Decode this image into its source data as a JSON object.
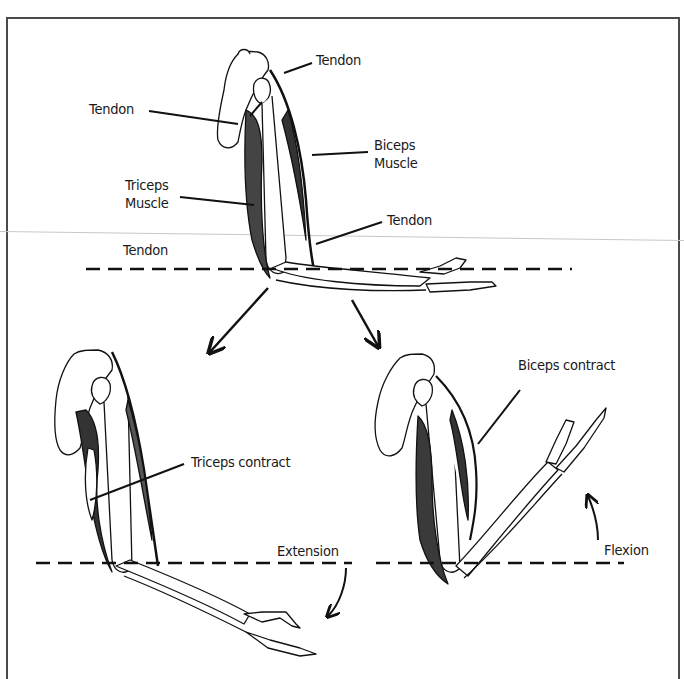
{
  "figure": {
    "colors": {
      "line": "#111111",
      "bone_fill": "#ffffff",
      "muscle": "#222222",
      "frame": "#4a4a4a"
    }
  },
  "top_arm": {
    "labels": {
      "tendon_top": "Tendon",
      "tendon_left": "Tendon",
      "biceps_line1": "Biceps",
      "biceps_line2": "Muscle",
      "triceps_line1": "Triceps",
      "triceps_line2": "Muscle",
      "tendon_right": "Tendon",
      "tendon_bottom": "Tendon"
    }
  },
  "extension_arm": {
    "labels": {
      "triceps_contract": "Triceps contract",
      "motion": "Extension"
    }
  },
  "flexion_arm": {
    "labels": {
      "biceps_contract": "Biceps contract",
      "motion": "Flexion"
    }
  }
}
